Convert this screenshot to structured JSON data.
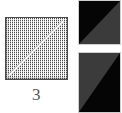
{
  "figure": {
    "caption": "3",
    "background_color": "#ffffff",
    "sample": {
      "label": "stippled-square-with-diagonal",
      "border_color": "#4a4a4a",
      "fill_color": "#ffffff",
      "dot_color": "#3c3c3c",
      "diagonal_color": "#f6f6f6",
      "diagonal_direction": "bottom-left-to-top-right"
    },
    "swatches": [
      {
        "name": "swatch-top",
        "dark_color": "#050505",
        "light_color": "#3b3b3b",
        "dark_region": "upper-left",
        "light_region": "lower-right",
        "diagonal_direction": "bottom-left-to-top-right"
      },
      {
        "name": "swatch-bottom",
        "dark_color": "#050505",
        "light_color": "#3b3b3b",
        "dark_region": "lower-right",
        "light_region": "upper-left",
        "diagonal_direction": "bottom-left-to-top-right"
      }
    ]
  }
}
